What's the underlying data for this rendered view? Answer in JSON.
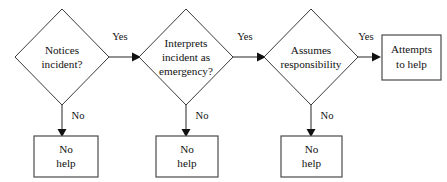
{
  "diagram": {
    "colors": {
      "background": "#ffffff",
      "stroke": "#3a3a3a",
      "box_stroke": "#4a4a4a",
      "text": "#111111",
      "arrowhead": "#111111"
    },
    "decisions": [
      {
        "id": "notices-incident",
        "lines": [
          "Notices",
          "incident?"
        ],
        "yes_label": "Yes",
        "no_label": "No",
        "cx": 62,
        "cy": 57,
        "rx": 47,
        "ry": 48
      },
      {
        "id": "interprets-emergency",
        "lines": [
          "Interprets",
          "incident as",
          "emergency?"
        ],
        "yes_label": "Yes",
        "no_label": "No",
        "cx": 186,
        "cy": 57,
        "rx": 47,
        "ry": 48
      },
      {
        "id": "assumes-responsibility",
        "lines": [
          "Assumes",
          "responsibility"
        ],
        "yes_label": "Yes",
        "no_label": "No",
        "cx": 311,
        "cy": 57,
        "rx": 47,
        "ry": 48
      }
    ],
    "no_outcomes": [
      {
        "id": "no-help-1",
        "lines": [
          "No",
          "help"
        ],
        "x": 34,
        "y": 136,
        "w": 64,
        "h": 41
      },
      {
        "id": "no-help-2",
        "lines": [
          "No",
          "help"
        ],
        "x": 156,
        "y": 136,
        "w": 62,
        "h": 41
      },
      {
        "id": "no-help-3",
        "lines": [
          "No",
          "help"
        ],
        "x": 281,
        "y": 136,
        "w": 61,
        "h": 41
      }
    ],
    "final_outcome": {
      "id": "attempts-to-help",
      "lines": [
        "Attempts",
        "to help"
      ],
      "x": 382,
      "y": 35,
      "w": 59,
      "h": 45
    }
  }
}
